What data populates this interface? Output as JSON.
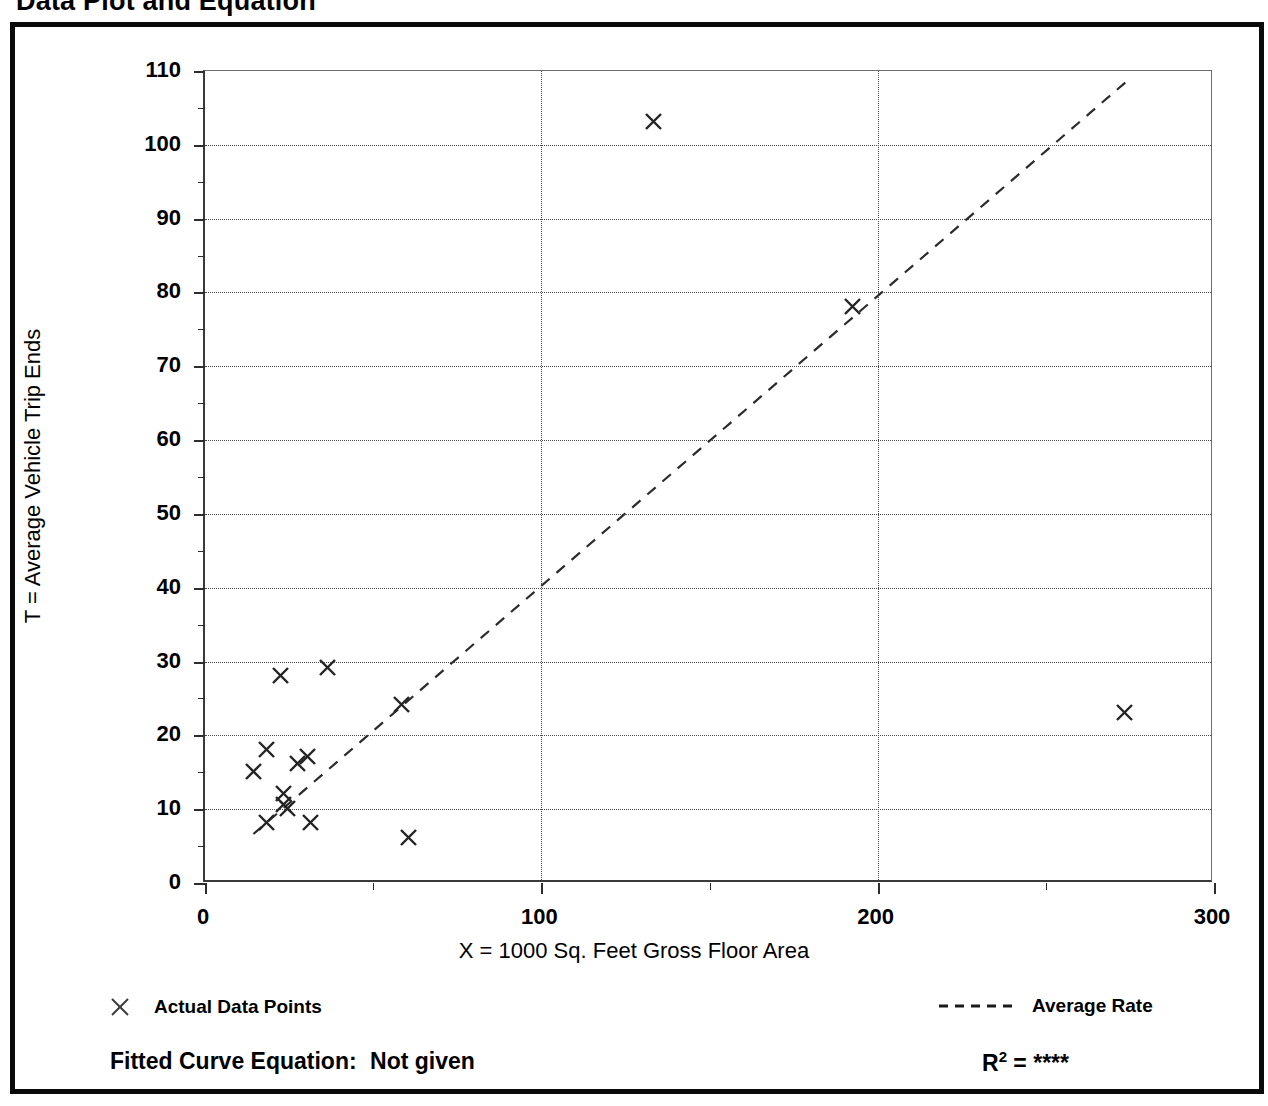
{
  "page": {
    "title": "Data Plot and Equation"
  },
  "legend": {
    "points_label": "Actual Data Points",
    "points_marker": "x-marker-icon",
    "rate_label": "Average Rate",
    "rate_marker": "dashed-line-icon"
  },
  "footer": {
    "equation_label": "Fitted Curve Equation:",
    "equation_value": "Not given",
    "r2_label": "R",
    "r2_exponent": "2",
    "r2_equals": "=",
    "r2_value": "****"
  },
  "chart_data": {
    "type": "scatter",
    "title": "Data Plot and Equation",
    "xlabel": "X = 1000 Sq. Feet Gross Floor Area",
    "ylabel": "T = Average Vehicle Trip Ends",
    "xlim": [
      0,
      300
    ],
    "ylim": [
      0,
      110
    ],
    "x_ticks": [
      0,
      100,
      200,
      300
    ],
    "x_tick_labels": [
      "0",
      "100",
      "200",
      "300"
    ],
    "x_minor_ticks": [
      50,
      150,
      250
    ],
    "y_ticks": [
      0,
      10,
      20,
      30,
      40,
      50,
      60,
      70,
      80,
      90,
      100,
      110
    ],
    "y_tick_labels": [
      "0",
      "10",
      "20",
      "30",
      "40",
      "50",
      "60",
      "70",
      "80",
      "90",
      "100",
      "110"
    ],
    "y_minor_ticks": [
      5,
      15,
      25,
      35,
      45,
      55,
      65,
      75,
      85,
      95,
      105
    ],
    "grid": {
      "horizontal": true,
      "vertical": true,
      "style": "dotted",
      "x_gridlines": [
        100,
        200
      ],
      "y_gridlines": [
        10,
        20,
        30,
        40,
        50,
        60,
        70,
        80,
        90,
        100
      ]
    },
    "legend_position": "below-axes",
    "series": [
      {
        "name": "Actual Data Points",
        "marker": "x",
        "points": [
          {
            "x": 15,
            "y": 15
          },
          {
            "x": 19,
            "y": 18
          },
          {
            "x": 19,
            "y": 8
          },
          {
            "x": 23,
            "y": 28
          },
          {
            "x": 24,
            "y": 12
          },
          {
            "x": 24,
            "y": 10.5
          },
          {
            "x": 25,
            "y": 10
          },
          {
            "x": 28,
            "y": 16
          },
          {
            "x": 31,
            "y": 17
          },
          {
            "x": 32,
            "y": 8
          },
          {
            "x": 37,
            "y": 29
          },
          {
            "x": 59,
            "y": 24
          },
          {
            "x": 61,
            "y": 6
          },
          {
            "x": 134,
            "y": 103
          },
          {
            "x": 193,
            "y": 78
          },
          {
            "x": 274,
            "y": 23
          }
        ]
      },
      {
        "name": "Average Rate",
        "type": "line",
        "style": "dashed",
        "endpoints": [
          {
            "x": 15,
            "y": 6.5
          },
          {
            "x": 276,
            "y": 109
          }
        ],
        "slope": 0.394
      }
    ]
  }
}
